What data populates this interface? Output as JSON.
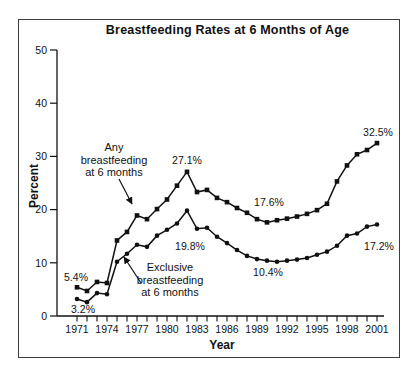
{
  "figure": {
    "background_color": "#ffffff",
    "frame_border_color": "#3d3d3d",
    "ink_color": "#111111"
  },
  "chart_data": {
    "type": "line",
    "title": "Breastfeeding Rates at 6 Months of Age",
    "xlabel": "Year",
    "ylabel": "Percent",
    "x_range": [
      1971,
      2001
    ],
    "ylim": [
      0,
      50
    ],
    "y_ticks": [
      0,
      10,
      20,
      30,
      40,
      50
    ],
    "x_labeled_ticks": [
      1971,
      1974,
      1977,
      1980,
      1983,
      1986,
      1989,
      1992,
      1995,
      1998,
      2001
    ],
    "x_minor_tick_every_years": 1,
    "grid": false,
    "legend_position": "inline-annotations",
    "series": [
      {
        "name": "Any breastfeeding at 6 months",
        "marker": "square",
        "color": "#111111",
        "x_start": 1971,
        "values": [
          5.4,
          4.7,
          6.4,
          6.2,
          14.2,
          15.8,
          18.9,
          18.2,
          20.1,
          21.9,
          24.5,
          27.1,
          23.3,
          23.7,
          22.2,
          21.4,
          20.3,
          19.4,
          18.2,
          17.6,
          18.0,
          18.3,
          18.7,
          19.2,
          19.9,
          21.1,
          25.3,
          28.3,
          30.4,
          31.2,
          32.5
        ]
      },
      {
        "name": "Exclusive breastfeeding at 6 months",
        "marker": "circle",
        "color": "#111111",
        "x_start": 1971,
        "values": [
          3.2,
          2.6,
          4.3,
          4.1,
          10.2,
          11.7,
          13.4,
          13.0,
          15.1,
          16.2,
          17.4,
          19.8,
          16.4,
          16.6,
          14.9,
          13.7,
          12.4,
          11.3,
          10.7,
          10.4,
          10.2,
          10.4,
          10.6,
          10.9,
          11.5,
          12.1,
          13.2,
          15.1,
          15.5,
          16.8,
          17.2
        ]
      }
    ],
    "point_labels": [
      {
        "text": "5.4%",
        "x": 76,
        "y": 281
      },
      {
        "text": "3.2%",
        "x": 83,
        "y": 313
      },
      {
        "text": "27.1%",
        "x": 187,
        "y": 164
      },
      {
        "text": "19.8%",
        "x": 190,
        "y": 250
      },
      {
        "text": "17.6%",
        "x": 269,
        "y": 206
      },
      {
        "text": "10.4%",
        "x": 268,
        "y": 276
      },
      {
        "text": "32.5%",
        "x": 378,
        "y": 136
      },
      {
        "text": "17.2%",
        "x": 379,
        "y": 250
      }
    ],
    "annotations": [
      {
        "text": "Any\nbreastfeeding\nat 6 months",
        "arrow": {
          "from": [
            119,
            179
          ],
          "to": [
            132,
            204
          ]
        }
      },
      {
        "text": "Exclusive\nbreastfeeding\nat 6 months",
        "arrow": {
          "from": [
            141,
            283
          ],
          "to": [
            124,
            257
          ]
        }
      }
    ],
    "plot_layout": {
      "x_of_first_year": 77,
      "px_per_year": 10,
      "y_of_zero": 316,
      "px_per_unit": 5.32,
      "axis_x": 57,
      "axis_right_end": 384
    }
  }
}
